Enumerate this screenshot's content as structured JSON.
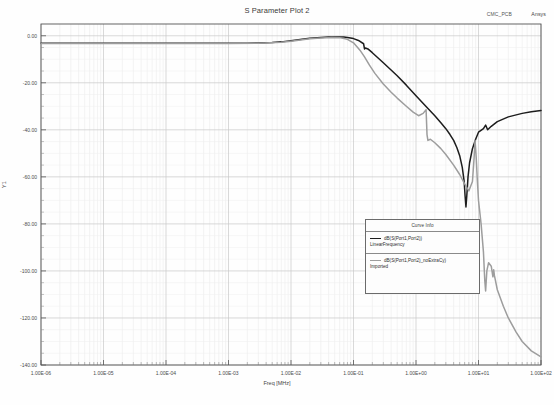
{
  "header": {
    "title": "S Parameter Plot 2",
    "design_name": "CMC_PCB",
    "vendor": "Ansys"
  },
  "legend": {
    "title": "Curve Info",
    "entries": [
      {
        "expression": "dB(S(Port1,Port2))",
        "sweep": "LinearFrequency",
        "color": "#1d1d1d"
      },
      {
        "expression": "dB(S(Port1,Port2)_noExtraCy)",
        "sweep": "Imported",
        "color": "#9d9d9d"
      }
    ]
  },
  "chart_data": {
    "type": "line",
    "title": "S Parameter Plot 2",
    "xlabel": "Freq [MHz]",
    "ylabel": "Y1",
    "xscale": "log",
    "xlim": [
      1e-06,
      100
    ],
    "ylim": [
      -140,
      5
    ],
    "grid": true,
    "legend_position": "center-right",
    "xtick_labels": [
      "1.00E-06",
      "1.00E-05",
      "1.00E-04",
      "1.00E-03",
      "1.00E-02",
      "1.00E-01",
      "1.00E+00",
      "1.00E+01",
      "1.00E+02"
    ],
    "xtick_values": [
      1e-06,
      1e-05,
      0.0001,
      0.001,
      0.01,
      0.1,
      1,
      10,
      100
    ],
    "ytick_labels": [
      "0.00",
      "-20.00",
      "-40.00",
      "-60.00",
      "-80.00",
      "-100.00",
      "-120.00",
      "-140.00"
    ],
    "ytick_values": [
      0,
      -20,
      -40,
      -60,
      -80,
      -100,
      -120,
      -140
    ],
    "series": [
      {
        "name": "dB(S(Port1,Port2))",
        "sweep": "LinearFrequency",
        "color": "#1d1d1d",
        "width": 1.5,
        "points": [
          [
            1e-06,
            -3.2
          ],
          [
            2e-06,
            -3.2
          ],
          [
            5e-06,
            -3.2
          ],
          [
            1e-05,
            -3.2
          ],
          [
            3e-05,
            -3.2
          ],
          [
            0.0001,
            -3.2
          ],
          [
            0.0003,
            -3.2
          ],
          [
            0.001,
            -3.2
          ],
          [
            0.002,
            -3.15
          ],
          [
            0.003,
            -3.1
          ],
          [
            0.005,
            -2.9
          ],
          [
            0.007,
            -2.6
          ],
          [
            0.01,
            -2.1
          ],
          [
            0.015,
            -1.5
          ],
          [
            0.02,
            -1.1
          ],
          [
            0.03,
            -0.7
          ],
          [
            0.04,
            -0.55
          ],
          [
            0.05,
            -0.5
          ],
          [
            0.06,
            -0.5
          ],
          [
            0.07,
            -0.55
          ],
          [
            0.08,
            -0.7
          ],
          [
            0.1,
            -1.2
          ],
          [
            0.12,
            -2.0
          ],
          [
            0.145,
            -3.4
          ],
          [
            0.15,
            -5.6
          ],
          [
            0.155,
            -5.2
          ],
          [
            0.17,
            -5.6
          ],
          [
            0.2,
            -7.2
          ],
          [
            0.3,
            -11.5
          ],
          [
            0.5,
            -17.0
          ],
          [
            0.7,
            -21.0
          ],
          [
            1.0,
            -25.5
          ],
          [
            1.5,
            -30.5
          ],
          [
            2.0,
            -34.0
          ],
          [
            2.5,
            -37.0
          ],
          [
            3.0,
            -39.5
          ],
          [
            3.5,
            -42.0
          ],
          [
            4.0,
            -44.5
          ],
          [
            4.5,
            -47.5
          ],
          [
            5.0,
            -51.0
          ],
          [
            5.5,
            -56.0
          ],
          [
            5.9,
            -62.0
          ],
          [
            6.1,
            -68.0
          ],
          [
            6.3,
            -72.8
          ],
          [
            6.5,
            -68.0
          ],
          [
            6.8,
            -60.0
          ],
          [
            7.2,
            -54.0
          ],
          [
            8.0,
            -48.0
          ],
          [
            9.0,
            -44.0
          ],
          [
            10.0,
            -41.0
          ],
          [
            12.0,
            -39.5
          ],
          [
            13.0,
            -38.0
          ],
          [
            14.0,
            -40.0
          ],
          [
            16.0,
            -38.5
          ],
          [
            20.0,
            -36.5
          ],
          [
            30.0,
            -34.5
          ],
          [
            50.0,
            -33.0
          ],
          [
            70.0,
            -32.3
          ],
          [
            100.0,
            -31.8
          ]
        ]
      },
      {
        "name": "dB(S(Port1,Port2)_noExtraCy)",
        "sweep": "Imported",
        "color": "#9d9d9d",
        "width": 1.5,
        "points": [
          [
            1e-06,
            -3.3
          ],
          [
            1e-05,
            -3.3
          ],
          [
            0.0001,
            -3.3
          ],
          [
            0.001,
            -3.3
          ],
          [
            0.003,
            -3.2
          ],
          [
            0.007,
            -2.8
          ],
          [
            0.01,
            -2.3
          ],
          [
            0.02,
            -1.3
          ],
          [
            0.03,
            -0.9
          ],
          [
            0.045,
            -0.7
          ],
          [
            0.06,
            -0.8
          ],
          [
            0.08,
            -1.5
          ],
          [
            0.1,
            -3.0
          ],
          [
            0.13,
            -6.5
          ],
          [
            0.15,
            -9.0
          ],
          [
            0.18,
            -12.5
          ],
          [
            0.22,
            -16.0
          ],
          [
            0.3,
            -20.5
          ],
          [
            0.4,
            -24.0
          ],
          [
            0.5,
            -26.5
          ],
          [
            0.7,
            -30.0
          ],
          [
            0.9,
            -32.5
          ],
          [
            1.1,
            -34.0
          ],
          [
            1.3,
            -33.0
          ],
          [
            1.45,
            -31.5
          ],
          [
            1.5,
            -42.0
          ],
          [
            1.55,
            -44.5
          ],
          [
            1.7,
            -44.0
          ],
          [
            2.0,
            -45.5
          ],
          [
            2.5,
            -48.0
          ],
          [
            3.0,
            -50.5
          ],
          [
            4.0,
            -55.0
          ],
          [
            5.0,
            -59.0
          ],
          [
            6.0,
            -63.0
          ],
          [
            7.0,
            -66.0
          ],
          [
            8.0,
            -62.0
          ],
          [
            8.5,
            -52.0
          ],
          [
            8.8,
            -44.5
          ],
          [
            9.2,
            -52.0
          ],
          [
            9.6,
            -62.0
          ],
          [
            10.0,
            -70.0
          ],
          [
            11.0,
            -80.0
          ],
          [
            12.0,
            -92.0
          ],
          [
            12.6,
            -104.0
          ],
          [
            13.0,
            -108.5
          ],
          [
            13.6,
            -100.0
          ],
          [
            14.5,
            -96.5
          ],
          [
            16.0,
            -98.0
          ],
          [
            17.0,
            -102.5
          ],
          [
            17.5,
            -99.5
          ],
          [
            18.0,
            -102.0
          ],
          [
            20.0,
            -108.0
          ],
          [
            25.0,
            -115.0
          ],
          [
            30.0,
            -120.0
          ],
          [
            40.0,
            -126.0
          ],
          [
            50.0,
            -130.0
          ],
          [
            70.0,
            -134.0
          ],
          [
            100.0,
            -136.5
          ]
        ]
      }
    ]
  }
}
